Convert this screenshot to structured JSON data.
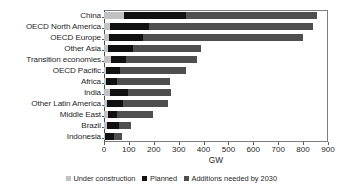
{
  "chart_data": {
    "type": "bar",
    "orientation": "horizontal",
    "stacked": true,
    "title": "",
    "xlabel": "GW",
    "ylabel": "",
    "xlim": [
      0,
      900
    ],
    "xticks": [
      0,
      100,
      200,
      300,
      400,
      500,
      600,
      700,
      800,
      900
    ],
    "grid": false,
    "legend_position": "bottom",
    "categories": [
      "China",
      "OECD North America",
      "OECD Europe",
      "Other Asia",
      "Transition economies",
      "OECD Pacific",
      "Africa",
      "India",
      "Other Latin America",
      "Middle East",
      "Brazil",
      "Indonesia"
    ],
    "series": [
      {
        "name": "Under construction",
        "color": "#c2c2c2",
        "values": [
          80,
          25,
          20,
          15,
          30,
          10,
          8,
          25,
          12,
          18,
          14,
          5
        ]
      },
      {
        "name": "Planned",
        "color": "#111111",
        "values": [
          250,
          155,
          135,
          100,
          60,
          55,
          45,
          70,
          65,
          35,
          45,
          35
        ]
      },
      {
        "name": "Additions needed by 2030",
        "color": "#4f4f4f",
        "values": [
          525,
          660,
          645,
          275,
          285,
          265,
          212,
          175,
          181,
          142,
          51,
          32
        ]
      }
    ],
    "totals": [
      855,
      840,
      800,
      390,
      375,
      330,
      265,
      270,
      258,
      195,
      110,
      72
    ]
  },
  "legend": {
    "entries": [
      {
        "label": "Under construction",
        "swatch": "legend-swatch-under-construction"
      },
      {
        "label": "Planned",
        "swatch": "legend-swatch-planned"
      },
      {
        "label": "Additions needed by 2030",
        "swatch": "legend-swatch-additions"
      }
    ]
  }
}
